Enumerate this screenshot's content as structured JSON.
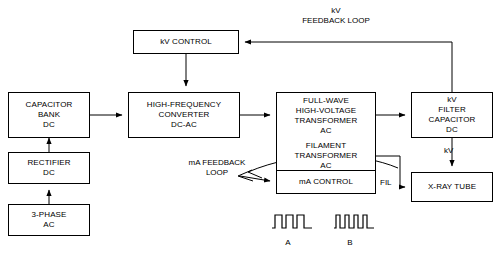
{
  "diagram": {
    "boxes": [
      {
        "name": "capacitor-bank-dc",
        "lines": [
          "CAPACITOR",
          "BANK",
          "DC"
        ],
        "x": 8,
        "y": 92,
        "w": 82,
        "h": 46
      },
      {
        "name": "rectifier-dc",
        "lines": [
          "RECTIFIER",
          "DC"
        ],
        "x": 8,
        "y": 152,
        "w": 82,
        "h": 32
      },
      {
        "name": "three-phase-ac",
        "lines": [
          "3-PHASE",
          "AC"
        ],
        "x": 8,
        "y": 204,
        "w": 82,
        "h": 32
      },
      {
        "name": "kv-control",
        "lines": [
          "kV CONTROL"
        ],
        "x": 133,
        "y": 30,
        "w": 106,
        "h": 24
      },
      {
        "name": "high-frequency-converter-dc-ac",
        "lines": [
          "HIGH-FREQUENCY",
          "CONVERTER",
          "DC-AC"
        ],
        "x": 128,
        "y": 92,
        "w": 112,
        "h": 46
      },
      {
        "name": "full-wave-high-voltage-transformer-ac",
        "lines": [
          "FULL-WAVE",
          "HIGH-VOLTAGE",
          "TRANSFORMER",
          "AC"
        ],
        "x": 276,
        "y": 92,
        "w": 100,
        "h": 46
      },
      {
        "name": "filament-transformer-ac",
        "lines": [
          "FILAMENT",
          "TRANSFORMER",
          "AC"
        ],
        "x": 276,
        "y": 138,
        "w": 100,
        "h": 36
      },
      {
        "name": "kv-filter-capacitor-dc",
        "lines": [
          "kV",
          "FILTER",
          "CAPACITOR",
          "DC"
        ],
        "x": 411,
        "y": 92,
        "w": 82,
        "h": 46
      },
      {
        "name": "ma-control",
        "lines": [
          "mA CONTROL"
        ],
        "x": 276,
        "y": 170,
        "w": 100,
        "h": 24
      },
      {
        "name": "x-ray-tube",
        "lines": [
          "X-RAY TUBE"
        ],
        "x": 411,
        "y": 172,
        "w": 82,
        "h": 30
      }
    ],
    "labels": [
      {
        "name": "kv-feedback-loop-label",
        "text": "kV\nFEEDBACK LOOP",
        "x": 276,
        "y": 6,
        "w": 120
      },
      {
        "name": "ma-feedback-loop-label",
        "text": "mA FEEDBACK\nLOOP",
        "x": 172,
        "y": 158,
        "w": 90
      },
      {
        "name": "kv-wire-label",
        "text": "kV",
        "x": 444,
        "y": 148,
        "w": 20
      },
      {
        "name": "fil-wire-label",
        "text": "FIL",
        "x": 380,
        "y": 180,
        "w": 22
      },
      {
        "name": "waveform-a-label",
        "text": "A",
        "x": 278,
        "y": 240,
        "w": 20
      },
      {
        "name": "waveform-b-label",
        "text": "B",
        "x": 340,
        "y": 240,
        "w": 20
      }
    ],
    "waveforms": [
      {
        "name": "waveform-a",
        "label": "A",
        "x": 272,
        "y": 212,
        "w": 40,
        "h": 18,
        "pulses": 3,
        "duty": "wide"
      },
      {
        "name": "waveform-b",
        "label": "B",
        "x": 334,
        "y": 212,
        "w": 40,
        "h": 18,
        "pulses": 4,
        "duty": "narrow"
      }
    ],
    "colors": {
      "line": "#000000",
      "background": "#ffffff",
      "text": "#000000"
    }
  }
}
